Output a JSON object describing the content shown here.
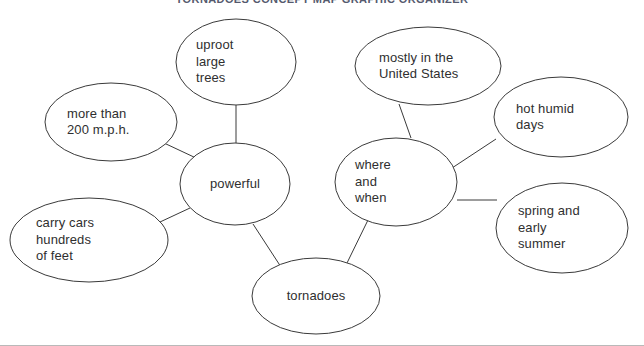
{
  "page": {
    "title": "TORNADOES CONCEPT MAP GRAPHIC ORGANIZER",
    "background_color": "#ffffff",
    "stroke_color": "#3a3a3a",
    "text_color": "#2f2f2f",
    "border_color": "#b9b9b9"
  },
  "diagram": {
    "type": "concept-map",
    "topic": "tornadoes",
    "nodes": [
      {
        "id": "tornadoes",
        "label": "tornadoes",
        "role": "topic",
        "align": "center",
        "cx": 316,
        "cy": 296,
        "rx": 64,
        "ry": 38
      },
      {
        "id": "powerful",
        "label": "powerful",
        "role": "branch",
        "align": "center",
        "cx": 235,
        "cy": 184,
        "rx": 55,
        "ry": 41
      },
      {
        "id": "where-and-when",
        "label": "where\nand\nwhen",
        "role": "branch",
        "align": "left",
        "cx": 396,
        "cy": 182,
        "rx": 61,
        "ry": 44
      },
      {
        "id": "uproot-large-trees",
        "label": "uproot\nlarge\ntrees",
        "role": "detail",
        "align": "left",
        "cx": 236,
        "cy": 62,
        "rx": 60,
        "ry": 43
      },
      {
        "id": "more-than-200-mph",
        "label": "more than\n200 m.p.h.",
        "role": "detail",
        "align": "left",
        "cx": 111,
        "cy": 122,
        "rx": 66,
        "ry": 39
      },
      {
        "id": "carry-cars-hundreds-of-feet",
        "label": "carry cars\nhundreds\nof feet",
        "role": "detail",
        "align": "left",
        "cx": 89,
        "cy": 240,
        "rx": 79,
        "ry": 42
      },
      {
        "id": "mostly-in-the-united-states",
        "label": "mostly in the\nUnited States",
        "role": "detail",
        "align": "left",
        "cx": 428,
        "cy": 66,
        "rx": 73,
        "ry": 39
      },
      {
        "id": "hot-humid-days",
        "label": "hot humid\ndays",
        "role": "detail",
        "align": "left",
        "cx": 561,
        "cy": 117,
        "rx": 67,
        "ry": 40
      },
      {
        "id": "spring-and-early-summer",
        "label": "spring and\nearly\nsummer",
        "role": "detail",
        "align": "left",
        "cx": 562,
        "cy": 228,
        "rx": 66,
        "ry": 45
      }
    ],
    "edges": [
      {
        "id": "edge-tornadoes-powerful",
        "from": "tornadoes",
        "to": "powerful",
        "x1": 281,
        "y1": 267,
        "x2": 253,
        "y2": 224
      },
      {
        "id": "edge-tornadoes-where",
        "from": "tornadoes",
        "to": "where-and-when",
        "x1": 347,
        "y1": 263,
        "x2": 368,
        "y2": 220
      },
      {
        "id": "edge-powerful-uproot",
        "from": "powerful",
        "to": "uproot-large-trees",
        "x1": 236,
        "y1": 143,
        "x2": 236,
        "y2": 105
      },
      {
        "id": "edge-powerful-mph",
        "from": "powerful",
        "to": "more-than-200-mph",
        "x1": 196,
        "y1": 158,
        "x2": 164,
        "y2": 143
      },
      {
        "id": "edge-powerful-carry",
        "from": "powerful",
        "to": "carry-cars-hundreds-of-feet",
        "x1": 190,
        "y1": 208,
        "x2": 160,
        "y2": 222
      },
      {
        "id": "edge-where-mostly",
        "from": "where-and-when",
        "to": "mostly-in-the-united-states",
        "x1": 411,
        "y1": 138,
        "x2": 399,
        "y2": 104
      },
      {
        "id": "edge-where-hot",
        "from": "where-and-when",
        "to": "hot-humid-days",
        "x1": 452,
        "y1": 168,
        "x2": 496,
        "y2": 139
      },
      {
        "id": "edge-where-spring",
        "from": "where-and-when",
        "to": "spring-and-early-summer",
        "x1": 457,
        "y1": 200,
        "x2": 497,
        "y2": 200
      }
    ]
  }
}
